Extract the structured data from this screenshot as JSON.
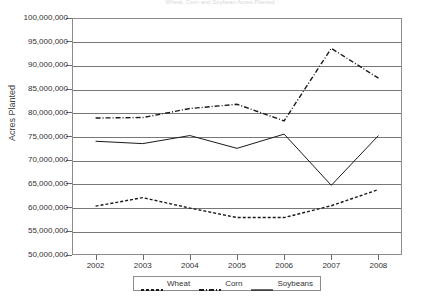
{
  "chart_data": {
    "type": "line",
    "title": "Wheat, Corn and Soybean Acres Planted",
    "xlabel": "",
    "ylabel": "Acres Planted",
    "categories": [
      "2002",
      "2003",
      "2004",
      "2005",
      "2006",
      "2007",
      "2008"
    ],
    "ylim": [
      50000000,
      100000000
    ],
    "ytick_step": 5000000,
    "ytick_labels": [
      "100,000,000",
      "95,000,000",
      "90,000,000",
      "85,000,000",
      "80,000,000",
      "75,000,000",
      "70,000,000",
      "65,000,000",
      "60,000,000",
      "55,000,000",
      "50,000,000"
    ],
    "grid": true,
    "legend_position": "bottom",
    "series": [
      {
        "name": "Wheat",
        "style": "dotted",
        "color": "#1a1a1a",
        "values": [
          60300000,
          62100000,
          59900000,
          57900000,
          57900000,
          60400000,
          63800000
        ]
      },
      {
        "name": "Corn",
        "style": "dash-dot",
        "color": "#1a1a1a",
        "values": [
          78900000,
          79000000,
          80900000,
          81800000,
          78300000,
          93600000,
          87300000
        ]
      },
      {
        "name": "Soybeans",
        "style": "solid",
        "color": "#1a1a1a",
        "values": [
          74000000,
          73500000,
          75200000,
          72500000,
          75500000,
          64700000,
          75200000
        ]
      }
    ]
  },
  "legend": {
    "items": [
      {
        "label": "Wheat",
        "swatch": "dotted-line-swatch"
      },
      {
        "label": "Corn",
        "swatch": "dash-dot-line-swatch"
      },
      {
        "label": "Soybeans",
        "swatch": "solid-line-swatch"
      }
    ]
  }
}
